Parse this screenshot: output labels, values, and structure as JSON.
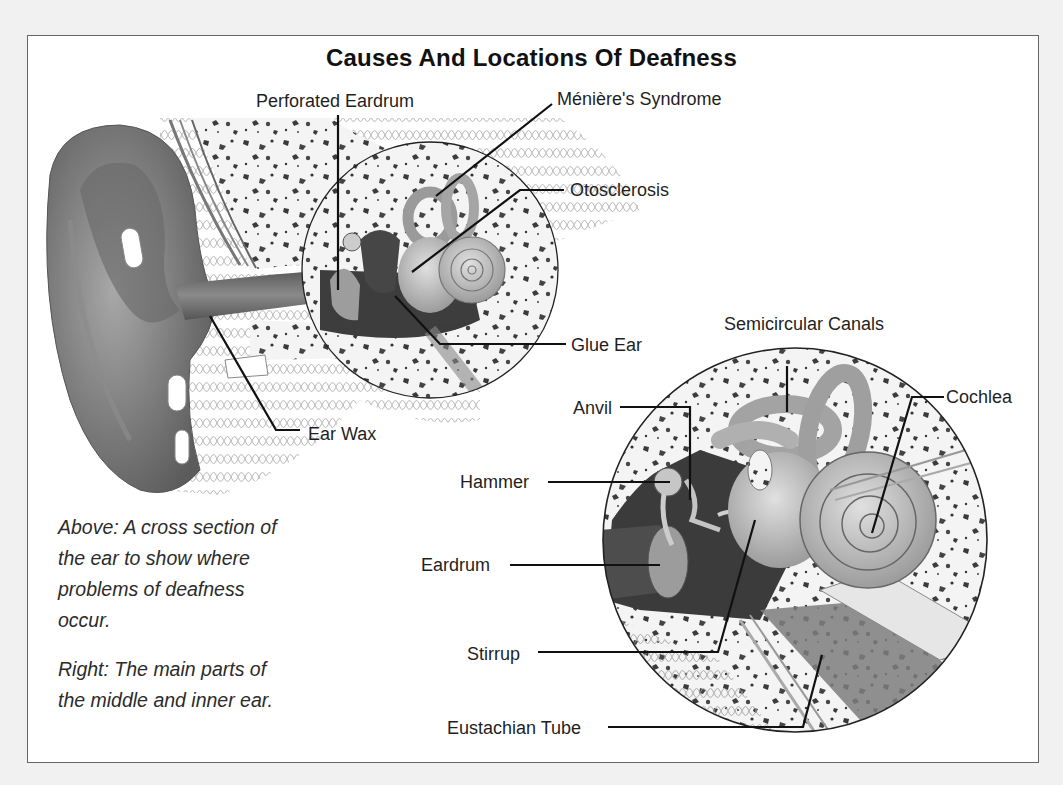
{
  "title": "Causes And Locations Of Deafness",
  "upper_diagram": {
    "labels": {
      "perforated_eardrum": "Perforated Eardrum",
      "menieres_syndrome": "Ménière's Syndrome",
      "otosclerosis": "Otosclerosis",
      "glue_ear": "Glue Ear",
      "ear_wax": "Ear Wax"
    }
  },
  "lower_diagram": {
    "labels": {
      "semicircular_canals": "Semicircular Canals",
      "cochlea": "Cochlea",
      "anvil": "Anvil",
      "hammer": "Hammer",
      "eardrum": "Eardrum",
      "stirrup": "Stirrup",
      "eustachian_tube": "Eustachian Tube"
    }
  },
  "captions": {
    "above": "Above: A cross section of the ear to show where problems of deafness occur.",
    "above_lines": [
      "Above: A cross section of",
      "the ear to show where",
      "problems of deafness",
      "occur."
    ],
    "right_lines": [
      "Right: The main parts of",
      "the middle and inner ear."
    ]
  },
  "colors": {
    "background": "#f1f1f1",
    "panel": "#ffffff",
    "frame_border": "#666666",
    "ink": "#1c1c1c",
    "bone": "#f3f3f3",
    "bone_speckle": "#3a3a3a",
    "skin_dark": "#6e6e6e",
    "skin_mid": "#9a9a9a",
    "inner_ear": "#c8c8c8"
  }
}
